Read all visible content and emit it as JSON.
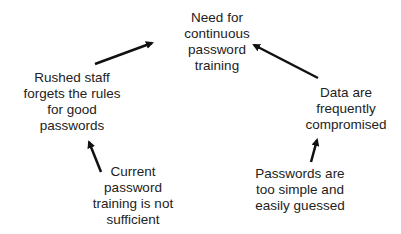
{
  "diagram": {
    "type": "cause-effect",
    "nodes": {
      "top": {
        "lines": [
          "Need for",
          "continuous",
          "password",
          "training"
        ]
      },
      "left": {
        "lines": [
          "Rushed staff",
          "forgets the rules",
          "for good",
          "passwords"
        ]
      },
      "right": {
        "lines": [
          "Data are",
          "frequently",
          "compromised"
        ]
      },
      "bottom_left": {
        "lines": [
          "Current",
          "password",
          "training is not",
          "sufficient"
        ]
      },
      "bottom_right": {
        "lines": [
          "Passwords are",
          "too simple and",
          "easily guessed"
        ]
      }
    },
    "edges": [
      {
        "from": "left",
        "to": "top"
      },
      {
        "from": "right",
        "to": "top"
      },
      {
        "from": "bottom_left",
        "to": "left"
      },
      {
        "from": "bottom_right",
        "to": "right"
      }
    ],
    "arrow_color": "#111111"
  }
}
